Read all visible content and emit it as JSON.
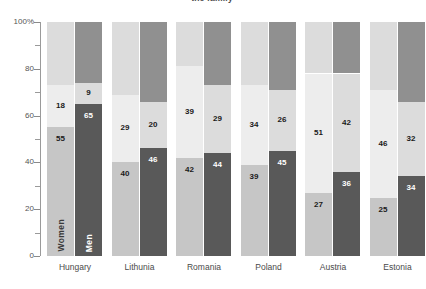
{
  "chart_data": {
    "type": "bar",
    "subtype": "stacked-100-grouped",
    "title": "the family",
    "xlabel": "",
    "ylabel": "",
    "ylim": [
      0,
      100
    ],
    "ytick_labels": [
      "0",
      "20",
      "40",
      "60",
      "80",
      "100%"
    ],
    "ytick_values": [
      0,
      20,
      40,
      60,
      80,
      100
    ],
    "minor_tick_values": [
      10,
      30,
      50,
      70,
      90
    ],
    "grid": false,
    "legend": "none",
    "series_names": [
      "Women",
      "Men"
    ],
    "segment_names": [
      "bottom",
      "middle",
      "top"
    ],
    "categories": [
      "Hungary",
      "Lithunia",
      "Romania",
      "Poland",
      "Austria",
      "Estonia"
    ],
    "series": [
      {
        "name": "Women",
        "segments": [
          {
            "name": "bottom",
            "values": [
              55,
              40,
              42,
              39,
              27,
              25
            ],
            "color": "#c6c6c6"
          },
          {
            "name": "middle",
            "values": [
              18,
              29,
              39,
              34,
              51,
              46
            ],
            "color": "#ededed"
          },
          {
            "name": "top",
            "values": [
              27,
              31,
              19,
              27,
              22,
              29
            ],
            "color": "#dcdcdc",
            "labeled": false
          }
        ]
      },
      {
        "name": "Men",
        "segments": [
          {
            "name": "bottom",
            "values": [
              65,
              46,
              44,
              45,
              36,
              34
            ],
            "color": "#595959"
          },
          {
            "name": "middle",
            "values": [
              9,
              20,
              29,
              26,
              42,
              32
            ],
            "color": "#dcdcdc"
          },
          {
            "name": "top",
            "values": [
              26,
              34,
              27,
              29,
              22,
              34
            ],
            "color": "#909090",
            "labeled": false
          }
        ]
      }
    ]
  },
  "axis": {
    "y_labels": [
      "100%",
      "80",
      "60",
      "40",
      "20",
      "0"
    ]
  },
  "colors": {
    "women_bottom": "#c6c6c6",
    "women_middle": "#ededed",
    "women_top": "#dcdcdc",
    "men_bottom": "#595959",
    "men_middle": "#dcdcdc",
    "men_top": "#909090",
    "axis": "#9a9a9a",
    "text": "#4a4a4a"
  }
}
